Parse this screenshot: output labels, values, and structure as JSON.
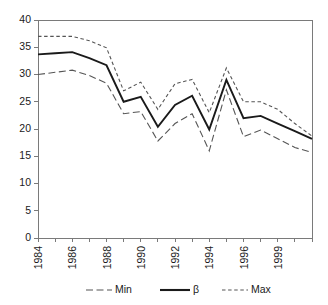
{
  "chart_data": {
    "type": "line",
    "title": "",
    "xlabel": "",
    "ylabel": "",
    "ylim": [
      0,
      40
    ],
    "ytick_values": [
      0,
      5,
      10,
      15,
      20,
      25,
      30,
      35,
      40
    ],
    "ytick_labels": [
      "0",
      "5",
      "10",
      "15",
      "20",
      "25",
      "30",
      "35",
      "40"
    ],
    "grid": false,
    "legend_position": "bottom",
    "x": [
      1984,
      1985,
      1986,
      1987,
      1988,
      1989,
      1990,
      1991,
      1992,
      1993,
      1994,
      1995,
      1996,
      1997,
      1998,
      1999,
      2000
    ],
    "categories": [
      "1984",
      "1985",
      "1986",
      "1987",
      "1988",
      "1989",
      "1990",
      "1991",
      "1992",
      "1993",
      "1994",
      "1995",
      "1996",
      "1997",
      "1998",
      "1999",
      "2000"
    ],
    "xtick_labels": [
      "1984",
      "",
      "1986",
      "",
      "1988",
      "",
      "1990",
      "",
      "1992",
      "",
      "1994",
      "",
      "1996",
      "",
      "1999",
      "",
      ""
    ],
    "xtick_labels_shown": [
      "1984",
      "1986",
      "1988",
      "1990",
      "1992",
      "1994",
      "1996",
      "1999"
    ],
    "series": [
      {
        "name": "Min",
        "style": "long-dash",
        "color": "#555555",
        "values": [
          30.0,
          30.4,
          30.8,
          29.8,
          28.4,
          22.8,
          23.2,
          17.8,
          21.0,
          22.8,
          16.0,
          27.2,
          18.6,
          19.8,
          18.2,
          16.6,
          15.7
        ]
      },
      {
        "name": "β",
        "style": "solid",
        "color": "#1a1a1a",
        "values": [
          33.7,
          33.9,
          34.1,
          33.0,
          31.7,
          25.0,
          25.9,
          20.4,
          24.4,
          26.1,
          19.9,
          29.0,
          22.0,
          22.4,
          21.0,
          19.6,
          18.2
        ]
      },
      {
        "name": "Max",
        "style": "short-dash",
        "color": "#555555",
        "values": [
          37.0,
          37.0,
          37.0,
          36.2,
          34.9,
          27.0,
          28.6,
          23.6,
          28.3,
          29.1,
          23.0,
          31.2,
          25.0,
          25.0,
          23.6,
          21.0,
          18.7
        ]
      }
    ],
    "legend": [
      {
        "label": "Min",
        "style": "long-dash"
      },
      {
        "label": "β",
        "style": "solid"
      },
      {
        "label": "Max",
        "style": "short-dash"
      }
    ]
  }
}
